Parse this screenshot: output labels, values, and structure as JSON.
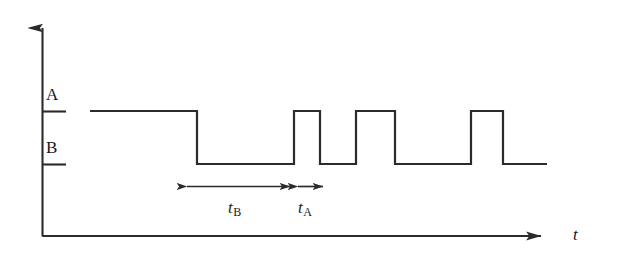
{
  "figure": {
    "kind": "timing-diagram",
    "background_color": "#ffffff",
    "stroke_color": "#2b2b2b",
    "axes": {
      "y_axis": {
        "label": "",
        "x": 42,
        "y_bottom": 236,
        "y_top": 14,
        "arrow": "up"
      },
      "x_axis": {
        "label": "t",
        "y": 236,
        "x_left": 42,
        "x_right": 555,
        "arrow": "right"
      }
    },
    "levels": [
      {
        "name": "A",
        "label": "A",
        "y": 111,
        "tick_x_start": 42,
        "tick_x_end": 66
      },
      {
        "name": "B",
        "label": "B",
        "y": 164,
        "tick_x_start": 42,
        "tick_x_end": 66
      }
    ],
    "signal": {
      "start_x": 90,
      "end_x": 547,
      "start_level": "A",
      "transitions_x": [
        197,
        294,
        320,
        356,
        395,
        471,
        503
      ],
      "polyline": "90,111 197,111 197,164 294,164 294,111 320,111 320,164 356,164 356,111 395,111 395,164 471,164 471,111 503,111 503,164 547,164"
    },
    "annotations": [
      {
        "name": "t-B-measure",
        "label_var": "t",
        "label_sub": "B",
        "y": 186,
        "x_start": 185,
        "x_end": 292,
        "arrow": "double",
        "label_x": 228,
        "label_y": 199
      },
      {
        "name": "t-A-measure",
        "label_var": "t",
        "label_sub": "A",
        "y": 186,
        "x_start": 296,
        "x_end": 325,
        "arrow": "double",
        "label_x": 298,
        "label_y": 199
      }
    ]
  },
  "chart_data": {
    "type": "line",
    "title": "",
    "xlabel": "t",
    "ylabel": "",
    "grid": false,
    "legend": null,
    "ytick_labels": [
      "A",
      "B"
    ],
    "ytick_values": [
      1,
      0
    ],
    "series": [
      {
        "name": "signal",
        "step": true,
        "points": [
          {
            "x": 90,
            "level": "A"
          },
          {
            "x": 197,
            "level": "A"
          },
          {
            "x": 197,
            "level": "B"
          },
          {
            "x": 294,
            "level": "B"
          },
          {
            "x": 294,
            "level": "A"
          },
          {
            "x": 320,
            "level": "A"
          },
          {
            "x": 320,
            "level": "B"
          },
          {
            "x": 356,
            "level": "B"
          },
          {
            "x": 356,
            "level": "A"
          },
          {
            "x": 395,
            "level": "A"
          },
          {
            "x": 395,
            "level": "B"
          },
          {
            "x": 471,
            "level": "B"
          },
          {
            "x": 471,
            "level": "A"
          },
          {
            "x": 503,
            "level": "A"
          },
          {
            "x": 503,
            "level": "B"
          },
          {
            "x": 547,
            "level": "B"
          }
        ]
      }
    ],
    "intervals": [
      {
        "label": "t_B",
        "from_x": 185,
        "to_x": 292,
        "width_px": 107
      },
      {
        "label": "t_A",
        "from_x": 296,
        "to_x": 325,
        "width_px": 29
      }
    ]
  }
}
